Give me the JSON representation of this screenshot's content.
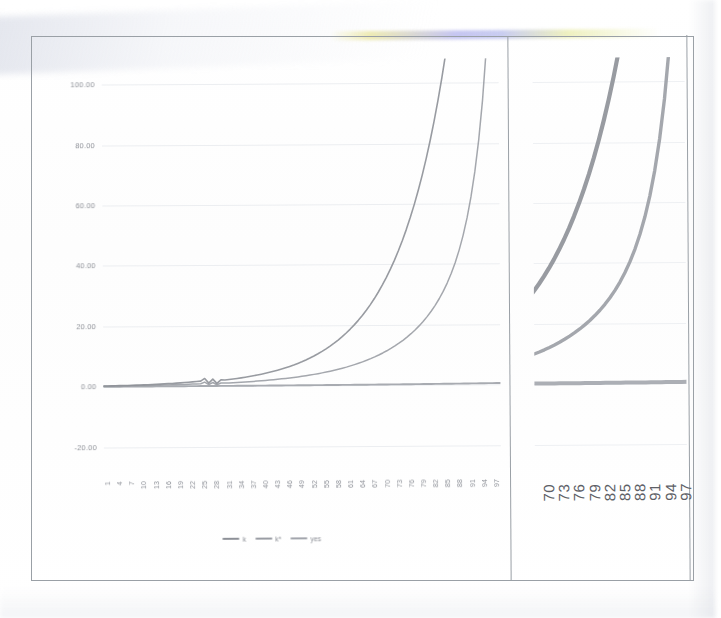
{
  "page": {
    "media": "scanned-printed-page",
    "background": "#ffffff"
  },
  "chart_data": {
    "type": "line",
    "title": "",
    "subtitle": "",
    "xlabel": "",
    "ylabel": "",
    "grid": true,
    "legend_position": "bottom-center",
    "ylim": [
      -30,
      108
    ],
    "yticks": [
      100,
      80,
      60,
      40,
      20,
      0,
      -20
    ],
    "ytick_labels": [
      "100.00",
      "80.00",
      "60.00",
      "40.00",
      "20.00",
      "0.00",
      "-20.00"
    ],
    "xlim": [
      1,
      99
    ],
    "xticks": [
      1,
      4,
      7,
      10,
      13,
      16,
      19,
      22,
      25,
      28,
      31,
      34,
      37,
      40,
      43,
      46,
      49,
      52,
      55,
      58,
      61,
      64,
      67,
      70,
      73,
      76,
      79,
      82,
      85,
      88,
      91,
      94,
      97
    ],
    "xtick_labels": [
      "1",
      "4",
      "7",
      "10",
      "13",
      "16",
      "19",
      "22",
      "25",
      "28",
      "31",
      "34",
      "37",
      "40",
      "43",
      "46",
      "49",
      "52",
      "55",
      "58",
      "61",
      "64",
      "67",
      "70",
      "73",
      "76",
      "79",
      "82",
      "85",
      "88",
      "91",
      "94",
      "97"
    ],
    "xtick_rotation": -90,
    "series": [
      {
        "name": "k",
        "color": "#8d9097",
        "values": [
          0.3,
          0.32,
          0.34,
          0.36,
          0.39,
          0.42,
          0.45,
          0.48,
          0.52,
          0.56,
          0.6,
          0.65,
          0.7,
          0.76,
          0.82,
          0.88,
          0.95,
          1.02,
          1.1,
          1.19,
          1.28,
          1.38,
          1.49,
          1.6,
          1.73,
          2.6,
          1.05,
          2.35,
          0.95,
          2.1,
          2.05,
          2.2,
          2.36,
          2.54,
          2.73,
          2.93,
          3.15,
          3.38,
          3.63,
          3.9,
          4.19,
          4.5,
          4.83,
          5.19,
          5.57,
          5.98,
          6.42,
          6.89,
          7.4,
          7.94,
          8.52,
          9.15,
          9.82,
          10.54,
          11.32,
          12.15,
          13.05,
          14.01,
          15.05,
          16.16,
          17.36,
          18.65,
          20.03,
          21.52,
          23.12,
          24.85,
          26.7,
          28.7,
          30.86,
          33.18,
          35.69,
          38.39,
          41.31,
          44.46,
          47.86,
          51.53,
          55.5,
          59.79,
          64.44,
          69.46,
          74.9,
          80.8,
          87.2,
          94.14,
          101.67,
          109.85,
          118.74,
          128.41,
          138.94,
          150.41,
          162.92,
          176.58,
          191.51,
          207.85,
          225.75,
          245.38,
          266.93,
          290.62,
          316.7
        ]
      },
      {
        "name": "k*",
        "color": "#9a9da4",
        "values": [
          0.22,
          0.23,
          0.24,
          0.26,
          0.27,
          0.29,
          0.3,
          0.32,
          0.34,
          0.36,
          0.38,
          0.4,
          0.43,
          0.45,
          0.48,
          0.51,
          0.54,
          0.57,
          0.6,
          0.64,
          0.68,
          0.72,
          0.76,
          0.81,
          0.86,
          1.4,
          0.55,
          1.25,
          0.5,
          1.05,
          1.02,
          1.08,
          1.14,
          1.21,
          1.28,
          1.36,
          1.44,
          1.53,
          1.62,
          1.72,
          1.82,
          1.93,
          2.05,
          2.18,
          2.31,
          2.45,
          2.6,
          2.76,
          2.93,
          3.11,
          3.3,
          3.51,
          3.73,
          3.96,
          4.21,
          4.47,
          4.75,
          5.05,
          5.37,
          5.71,
          6.07,
          6.46,
          6.87,
          7.31,
          7.78,
          8.28,
          8.82,
          9.4,
          10.02,
          10.68,
          11.39,
          12.16,
          12.98,
          13.87,
          14.83,
          15.87,
          17.0,
          18.22,
          19.56,
          21.02,
          22.62,
          24.38,
          26.33,
          28.5,
          30.93,
          33.68,
          36.81,
          40.4,
          44.56,
          49.44,
          55.21,
          62.13,
          70.56,
          80.99,
          94.15,
          111.16,
          133.83,
          165.0,
          209.5
        ]
      },
      {
        "name": "yes",
        "color": "#a3a6ad",
        "values": [
          0.05,
          0.05,
          0.05,
          0.05,
          0.05,
          0.06,
          0.06,
          0.06,
          0.06,
          0.06,
          0.06,
          0.07,
          0.07,
          0.07,
          0.07,
          0.07,
          0.07,
          0.08,
          0.08,
          0.08,
          0.08,
          0.08,
          0.08,
          0.09,
          0.09,
          0.09,
          0.09,
          0.09,
          0.09,
          0.1,
          0.1,
          0.1,
          0.1,
          0.1,
          0.11,
          0.11,
          0.11,
          0.11,
          0.12,
          0.12,
          0.12,
          0.12,
          0.13,
          0.13,
          0.13,
          0.13,
          0.14,
          0.14,
          0.14,
          0.15,
          0.15,
          0.15,
          0.16,
          0.16,
          0.16,
          0.17,
          0.17,
          0.18,
          0.18,
          0.18,
          0.19,
          0.19,
          0.2,
          0.2,
          0.21,
          0.21,
          0.22,
          0.22,
          0.23,
          0.24,
          0.24,
          0.25,
          0.25,
          0.26,
          0.27,
          0.27,
          0.28,
          0.29,
          0.3,
          0.3,
          0.31,
          0.32,
          0.33,
          0.34,
          0.35,
          0.36,
          0.37,
          0.38,
          0.39,
          0.4,
          0.41,
          0.42,
          0.43,
          0.45,
          0.46,
          0.47,
          0.49,
          0.5,
          0.52
        ]
      }
    ],
    "detail_panel": {
      "description": "zoomed detail of the tail region",
      "xlim": [
        69,
        99
      ],
      "xticks": [
        70,
        73,
        76,
        79,
        82,
        85,
        88,
        91,
        94,
        97
      ],
      "xtick_labels": [
        "70",
        "73",
        "76",
        "79",
        "82",
        "85",
        "88",
        "91",
        "94",
        "97"
      ],
      "xtick_rotation": -90,
      "yticks": [
        100,
        80,
        60,
        40,
        20,
        0,
        -20
      ],
      "grid": true
    }
  },
  "legend": {
    "items": [
      {
        "label": "k",
        "color": "#8d9097"
      },
      {
        "label": "k*",
        "color": "#9a9da4"
      },
      {
        "label": "yes",
        "color": "#a3a6ad"
      }
    ]
  },
  "frame": {
    "border_color": "#9aa0a6"
  }
}
